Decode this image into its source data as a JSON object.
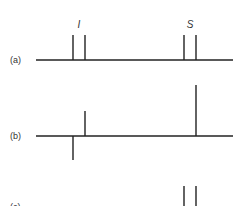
{
  "figure": {
    "panels": [
      {
        "label": "(a)",
        "baseline_y": 60,
        "lines": [
          {
            "x": 73,
            "height": 25,
            "dir": "up"
          },
          {
            "x": 85,
            "height": 25,
            "dir": "up"
          },
          {
            "x": 184,
            "height": 25,
            "dir": "up"
          },
          {
            "x": 196,
            "height": 25,
            "dir": "up"
          }
        ]
      },
      {
        "label": "(b)",
        "baseline_y": 136,
        "lines": [
          {
            "x": 73,
            "height": 24,
            "dir": "down"
          },
          {
            "x": 85,
            "height": 25,
            "dir": "up"
          },
          {
            "x": 196,
            "height": 51,
            "dir": "up"
          }
        ]
      },
      {
        "label": "(c)",
        "baseline_y": 215,
        "lines": [
          {
            "x": 184,
            "height": 29,
            "dir": "up"
          },
          {
            "x": 196,
            "height": 29,
            "dir": "up"
          }
        ]
      }
    ],
    "group_labels": [
      {
        "text": "I",
        "x": 79,
        "y": 28
      },
      {
        "text": "S",
        "x": 190,
        "y": 28
      }
    ],
    "colors": {
      "line": "#222222",
      "background": "#ffffff"
    }
  }
}
